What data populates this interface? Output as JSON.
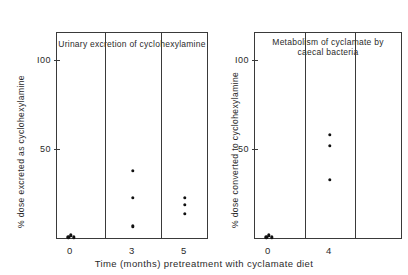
{
  "figure": {
    "xlabel": "Time (months) pretreatment with cyclamate diet",
    "marker_color": "#111111",
    "axis_color": "#3a3a3a"
  },
  "panels": [
    {
      "id": "urinary-excretion",
      "title": "Urinary excretion of cyclohexylamine",
      "ylabel": "% dose excreted as cyclohexylamine",
      "yticks": [
        "100",
        "50"
      ],
      "xticks": [
        "0",
        "3",
        "5"
      ]
    },
    {
      "id": "caecal-metabolism",
      "title": "Metabolism of cyclamate by\ncaecal bacteria",
      "ylabel": "% dose converted to cyclohexylamine",
      "yticks": [
        "100",
        "50"
      ],
      "xticks": [
        "0",
        "4"
      ]
    }
  ],
  "chart_data": [
    {
      "type": "scatter",
      "title": "Urinary excretion of cyclohexylamine",
      "xlabel": "Time (months) pretreatment with cyclamate diet",
      "ylabel": "% dose excreted as cyclohexylamine",
      "ylim": [
        0,
        115
      ],
      "yticks": [
        50,
        100
      ],
      "categories": [
        0,
        3,
        5
      ],
      "xtick_labels": [
        "0",
        "3",
        "5"
      ],
      "grid": false,
      "legend": "none",
      "series": [
        {
          "name": "0 months",
          "x": [
            0,
            0,
            0
          ],
          "values": [
            1,
            1,
            2
          ],
          "jitter_x": [
            -0.12,
            0.12,
            0.0
          ]
        },
        {
          "name": "3 months",
          "x": [
            3,
            3,
            3
          ],
          "values": [
            38,
            23,
            7
          ],
          "jitter_x": [
            0,
            0,
            0
          ]
        },
        {
          "name": "5 months",
          "x": [
            5,
            5,
            5
          ],
          "values": [
            23,
            19,
            14
          ],
          "jitter_x": [
            0,
            0,
            0
          ]
        }
      ]
    },
    {
      "type": "scatter",
      "title": "Metabolism of cyclamate by caecal bacteria",
      "xlabel": "Time (months) pretreatment with cyclamate diet",
      "ylabel": "% dose converted to cyclohexylamine",
      "ylim": [
        0,
        115
      ],
      "yticks": [
        50,
        100
      ],
      "categories": [
        0,
        4
      ],
      "xtick_labels": [
        "0",
        "4"
      ],
      "grid": false,
      "legend": "none",
      "series": [
        {
          "name": "0 months",
          "x": [
            0,
            0,
            0
          ],
          "values": [
            1,
            1,
            2
          ],
          "jitter_x": [
            -0.12,
            0.12,
            0.0
          ]
        },
        {
          "name": "4 months",
          "x": [
            4,
            4,
            4
          ],
          "values": [
            58,
            52,
            33
          ],
          "jitter_x": [
            0,
            0,
            0
          ]
        }
      ]
    }
  ]
}
